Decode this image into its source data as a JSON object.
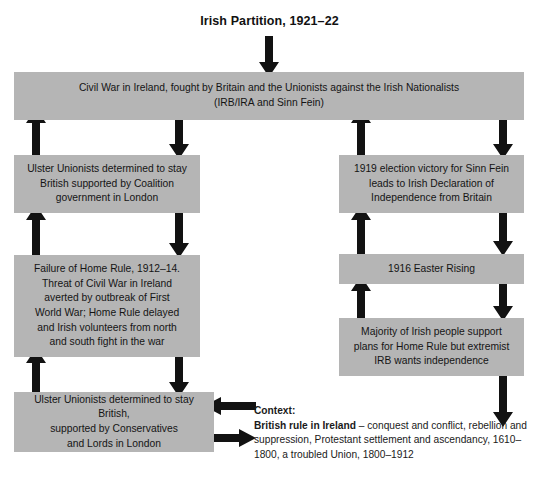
{
  "title": "Irish Partition, 1921–22",
  "colors": {
    "box_fill": "#b5b5b5",
    "arrow": "#121212",
    "text": "#141414",
    "background": "#ffffff"
  },
  "boxes": {
    "top_banner": {
      "line1": "Civil War in Ireland, fought by Britain and the Unionists against the Irish Nationalists",
      "line2": "(IRB/IRA and Sinn Fein)"
    },
    "left_1": {
      "line1": "Ulster Unionists determined to stay",
      "line2": "British supported by Coalition",
      "line3": "government in London"
    },
    "left_2": {
      "line1": "Failure of Home Rule, 1912–14.",
      "line2": "Threat of Civil War in Ireland",
      "line3": "averted by outbreak of First",
      "line4": "World War; Home Rule delayed",
      "line5": "and Irish volunteers from north",
      "line6": "and south fight in the war"
    },
    "left_3": {
      "line1": "Ulster Unionists determined to stay",
      "line2": "British,",
      "line3": "supported by Conservatives",
      "line4": "and Lords in London"
    },
    "right_1": {
      "line1": "1919 election victory for Sinn Fein",
      "line2": "leads to Irish Declaration of",
      "line3": "Independence from Britain"
    },
    "right_2": {
      "line1": "1916 Easter Rising"
    },
    "right_3": {
      "line1": "Majority of Irish people support",
      "line2": "plans for Home Rule but extremist",
      "line3": "IRB wants independence"
    }
  },
  "context": {
    "heading": "Context:",
    "lead": "British rule in Ireland",
    "body": " – conquest and conflict, rebellion and suppression, Protestant settlement and ascendancy, 1610–1800, a troubled Union, 1800–1912"
  },
  "arrows": {
    "title_to_banner": "down-arrow",
    "left_col_up_1": "up-arrow",
    "left_col_up_2": "up-arrow",
    "left_col_up_3": "up-arrow",
    "left_col_down_1": "down-arrow",
    "left_col_down_2": "down-arrow",
    "left_col_down_3": "down-arrow",
    "right_col_up_1": "up-arrow",
    "right_col_up_2": "up-arrow",
    "right_col_up_3": "up-arrow",
    "right_col_down_1": "down-arrow",
    "right_col_down_2": "down-arrow",
    "right_col_down_3": "down-arrow",
    "right_col_down_4": "down-arrow",
    "context_to_left_box": "left-arrow",
    "left_box_to_context": "right-arrow"
  }
}
